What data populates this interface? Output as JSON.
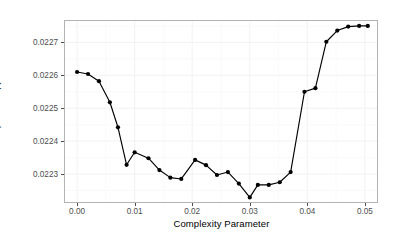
{
  "chart_data": {
    "type": "line",
    "title": "",
    "subtitle": "",
    "xlabel": "Complexity Parameter",
    "ylabel": "RMSE (Bootstrap)",
    "xlim": [
      -0.0021,
      0.0521
    ],
    "ylim": [
      0.022215,
      0.022765
    ],
    "xticks": [
      0.0,
      0.01,
      0.02,
      0.03,
      0.04,
      0.05
    ],
    "xticklabels": [
      "0.00",
      "0.01",
      "0.02",
      "0.03",
      "0.04",
      "0.05"
    ],
    "yticks": [
      0.0223,
      0.0224,
      0.0225,
      0.0226,
      0.0227
    ],
    "yticklabels": [
      "0.0223",
      "0.0224",
      "0.0225",
      "0.0226",
      "0.0227"
    ],
    "grid": true,
    "legend": "none",
    "marker": "filled-circle",
    "line_color": "#000000",
    "point_color": "#000000",
    "panel_border_color": "#b3b3b3",
    "gridline_color": "#f2f2f2",
    "background_color": "#ffffff",
    "series": [
      {
        "name": "RMSE (Bootstrap)",
        "x": [
          0.0,
          0.0019,
          0.0038,
          0.0057,
          0.0071,
          0.0086,
          0.01,
          0.0124,
          0.0143,
          0.0162,
          0.0181,
          0.0205,
          0.0224,
          0.0243,
          0.0262,
          0.0281,
          0.03,
          0.0314,
          0.0333,
          0.0352,
          0.0371,
          0.0395,
          0.0414,
          0.0433,
          0.0452,
          0.0471,
          0.049,
          0.0505
        ],
        "y": [
          0.02261,
          0.022604,
          0.022582,
          0.022518,
          0.022442,
          0.022328,
          0.022366,
          0.022348,
          0.022312,
          0.022289,
          0.022285,
          0.022343,
          0.022327,
          0.022297,
          0.022306,
          0.022271,
          0.022229,
          0.022267,
          0.022267,
          0.022275,
          0.022306,
          0.02255,
          0.022561,
          0.022702,
          0.022736,
          0.022748,
          0.02275,
          0.02275
        ]
      }
    ]
  },
  "axis": {
    "x_title": "Complexity Parameter",
    "y_title": "RMSE (Bootstrap)"
  }
}
